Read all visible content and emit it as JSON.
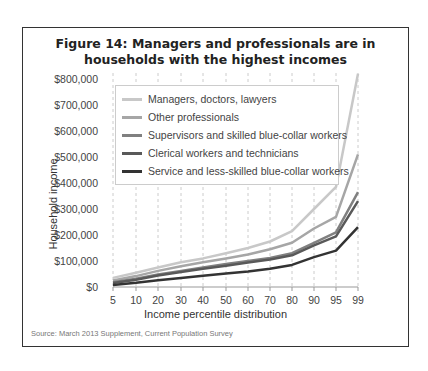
{
  "figure": {
    "title_line1": "Figure 14: Managers and professionals are in",
    "title_line2": "households with the highest incomes",
    "source": "Source: March 2013 Supplement, Current Population Survey"
  },
  "chart_data": {
    "type": "line",
    "title": "Figure 14: Managers and professionals are in households with the highest incomes",
    "xlabel": "Income percentile distribution",
    "ylabel": "Household income",
    "x": [
      5,
      10,
      20,
      30,
      40,
      50,
      60,
      70,
      80,
      90,
      95,
      99
    ],
    "x_tick_labels": [
      "5",
      "10",
      "20",
      "30",
      "40",
      "50",
      "60",
      "70",
      "80",
      "90",
      "95",
      "99"
    ],
    "y_tick_labels": [
      "$0",
      "$100,000",
      "$200,000",
      "$300,000",
      "$400,000",
      "$500,000",
      "$600,000",
      "$700,000",
      "$800,000"
    ],
    "ylim": [
      0,
      800000
    ],
    "grid": "vertical dashed",
    "legend_position": "upper left",
    "series": [
      {
        "name": "Managers, doctors, lawyers",
        "color": "#c8c8c8",
        "values": [
          35000,
          55000,
          75000,
          95000,
          110000,
          130000,
          150000,
          175000,
          215000,
          300000,
          385000,
          820000
        ]
      },
      {
        "name": "Other professionals",
        "color": "#a6a6a6",
        "values": [
          25000,
          42000,
          62000,
          80000,
          95000,
          110000,
          125000,
          145000,
          170000,
          225000,
          270000,
          510000
        ]
      },
      {
        "name": "Supervisors and skilled blue-collar workers",
        "color": "#808080",
        "values": [
          18000,
          32000,
          48000,
          62000,
          75000,
          88000,
          100000,
          112000,
          130000,
          170000,
          210000,
          365000
        ]
      },
      {
        "name": "Clerical workers and technicians",
        "color": "#595959",
        "values": [
          15000,
          28000,
          44000,
          58000,
          70000,
          82000,
          94000,
          106000,
          122000,
          160000,
          195000,
          330000
        ]
      },
      {
        "name": "Service and less-skilled blue-collar workers",
        "color": "#333333",
        "values": [
          8000,
          16000,
          26000,
          35000,
          43000,
          52000,
          60000,
          70000,
          85000,
          115000,
          140000,
          230000
        ]
      }
    ]
  }
}
